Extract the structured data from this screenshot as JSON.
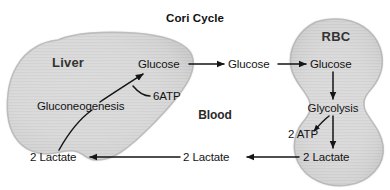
{
  "diagram": {
    "title": "Cori Cycle",
    "type": "metabolic-pathway-diagram",
    "background_color": "#ffffff",
    "text_color": "#141414",
    "tissue_fill_color": "#d9d9d9",
    "tissue_edge_color": "#9a9a9a",
    "arrow_color": "#1a1a1a"
  },
  "compartments": {
    "liver": {
      "label": "Liver",
      "shape": "liver-organ"
    },
    "blood": {
      "label": "Blood",
      "shape": "open-space"
    },
    "rbc": {
      "label": "RBC",
      "shape": "biconcave-erythrocyte"
    }
  },
  "metabolites": {
    "glucose_liver": "Glucose",
    "glucose_blood": "Glucose",
    "glucose_rbc": "Glucose",
    "lactate_liver": "2 Lactate",
    "lactate_blood": "2 Lactate",
    "lactate_rbc": "2 Lactate"
  },
  "processes": {
    "gluconeogenesis": "Gluconeogenesis",
    "glycolysis": "Glycolysis"
  },
  "energy": {
    "atp_consumed": "6ATP",
    "atp_produced": "2 ATP"
  }
}
